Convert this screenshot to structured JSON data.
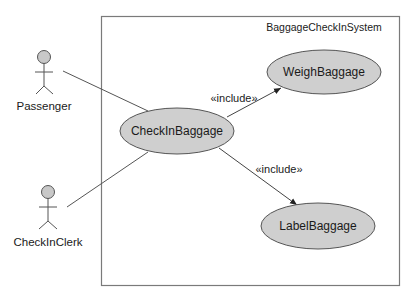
{
  "diagram": {
    "type": "use-case",
    "system": {
      "name": "BaggageCheckInSystem"
    },
    "actors": [
      {
        "id": "passenger",
        "name": "Passenger"
      },
      {
        "id": "clerk",
        "name": "CheckInClerk"
      }
    ],
    "use_cases": [
      {
        "id": "checkin",
        "name": "CheckInBaggage"
      },
      {
        "id": "weigh",
        "name": "WeighBaggage"
      },
      {
        "id": "label",
        "name": "LabelBaggage"
      }
    ],
    "associations": [
      {
        "from": "passenger",
        "to": "checkin"
      },
      {
        "from": "clerk",
        "to": "checkin"
      }
    ],
    "includes": [
      {
        "from": "checkin",
        "to": "weigh",
        "label": "«include»"
      },
      {
        "from": "checkin",
        "to": "label",
        "label": "«include»"
      }
    ],
    "colors": {
      "use_case_fill": "#cfcfcf",
      "actor_head_fill": "#c8c8c8",
      "stroke": "#555555",
      "boundary": "#7a7a7a"
    }
  }
}
